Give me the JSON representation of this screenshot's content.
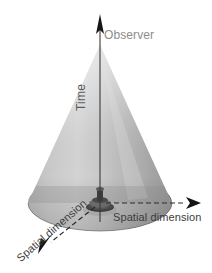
{
  "figure": {
    "kind": "light-cone-spacetime-diagram",
    "width": 212,
    "height": 273,
    "background_color": "#ffffff"
  },
  "labels": {
    "observer": "Observer",
    "time": "Time",
    "spatial_dimension_horizontal": "Spatial dimension",
    "spatial_dimension_diagonal": "Spatial dimension"
  },
  "colors": {
    "background": "#ffffff",
    "cone_light": "#d6d6d6",
    "cone_mid": "#b4b4b4",
    "cone_dark": "#8f8f8f",
    "base_ellipse": "#9a9a9a",
    "base_ellipse_dark": "#6f6f6f",
    "axis_line": "#3a3a3a",
    "arrow_fill": "#1b1b1b",
    "observer_label": "#8d8d8d",
    "time_label": "#5b5b5b",
    "space_label": "#3c3c3c",
    "pedestal": "#5a5a5a"
  },
  "geometry": {
    "apex": {
      "x": 100,
      "y": 45
    },
    "center": {
      "x": 100,
      "y": 203
    },
    "base_ellipse": {
      "cx": 100,
      "cy": 203,
      "rx": 72,
      "ry": 28
    },
    "time_axis": {
      "x": 100,
      "y_top": 16,
      "y_bottom": 222
    },
    "axis_horizontal": {
      "x_start": 108,
      "x_end": 196,
      "y": 203
    },
    "axis_diagonal": {
      "x_start": 93,
      "y_start": 209,
      "x_end": 38,
      "y_end": 252
    }
  },
  "elements": {
    "cone_name": "light-cone",
    "time_arrow_name": "time-axis-arrow",
    "horizontal_arrow_name": "spatial-axis-horizontal-arrow",
    "diagonal_arrow_name": "spatial-axis-diagonal-arrow",
    "observer_marker_name": "observer-marker"
  }
}
